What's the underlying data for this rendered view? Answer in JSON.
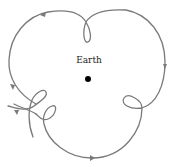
{
  "diagram": {
    "labels": {
      "earth": "Earth"
    },
    "colors": {
      "path": "#7a7a7a",
      "earth": "#000000",
      "text": "#222222",
      "background": "#ffffff"
    },
    "nodes": [
      {
        "id": "earth",
        "label": "Earth",
        "x": 88,
        "y": 79
      }
    ],
    "path_features": {
      "loops": [
        "top",
        "right",
        "bottom-left-1",
        "bottom-left-2"
      ],
      "direction_arrows": 5
    }
  }
}
